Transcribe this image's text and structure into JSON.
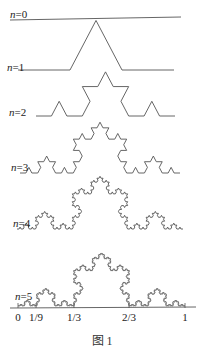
{
  "figure": {
    "caption": "图 1",
    "stroke_color": "#555555",
    "levels": [
      {
        "n": 0,
        "label_var": "n",
        "label_eq": "=0",
        "x0": 10,
        "x1": 181,
        "y": 19,
        "label_x": 10,
        "label_y": 9
      },
      {
        "n": 1,
        "label_var": "n",
        "label_eq": "=1",
        "x0": 18,
        "x1": 174,
        "y": 70,
        "label_x": 7,
        "label_y": 62
      },
      {
        "n": 2,
        "label_var": "n",
        "label_eq": "=2",
        "x0": 36,
        "x1": 175,
        "y": 116,
        "label_x": 9,
        "label_y": 107
      },
      {
        "n": 3,
        "label_var": "n",
        "label_eq": "=3",
        "x0": 20,
        "x1": 180,
        "y": 173,
        "label_x": 11,
        "label_y": 162
      },
      {
        "n": 4,
        "label_var": "n",
        "label_eq": "=4",
        "x0": 17,
        "x1": 183,
        "y": 229,
        "label_x": 13,
        "label_y": 218
      },
      {
        "n": 5,
        "label_var": "n",
        "label_eq": "=5",
        "x0": 18,
        "x1": 185,
        "y": 306,
        "label_x": 15,
        "label_y": 291
      }
    ],
    "axis": {
      "x0": 10,
      "x1": 196,
      "y": 308,
      "ticks": [
        {
          "label": "0",
          "x": 18
        },
        {
          "label": "1/9",
          "x": 36
        },
        {
          "label": "1/3",
          "x": 74
        },
        {
          "label": "2/3",
          "x": 129
        },
        {
          "label": "1",
          "x": 185
        }
      ]
    }
  }
}
